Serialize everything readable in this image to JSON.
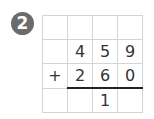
{
  "badge": {
    "number": "2"
  },
  "problem": {
    "operator": "+",
    "rows": [
      [
        "",
        "",
        "",
        ""
      ],
      [
        "",
        "4",
        "5",
        "9"
      ],
      [
        "+",
        "2",
        "6",
        "0"
      ],
      [
        "",
        "",
        "1",
        ""
      ]
    ]
  }
}
